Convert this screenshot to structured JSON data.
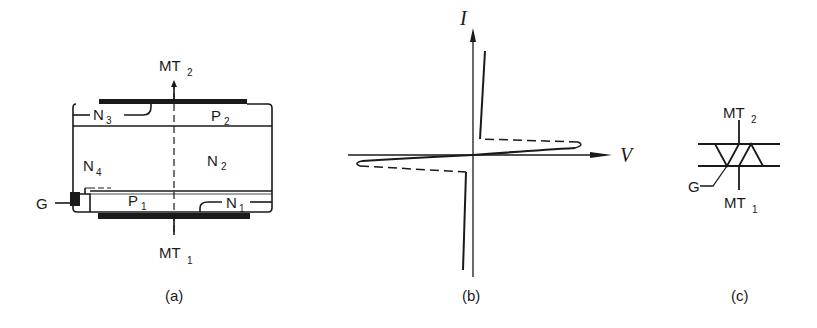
{
  "figure": {
    "panels": [
      {
        "id": "a",
        "caption": "(a)",
        "description": "Triac cross-section structure",
        "terminals": {
          "top": "MT",
          "top_sub": "2",
          "bottom": "MT",
          "bottom_sub": "1",
          "gate": "G"
        },
        "regions": [
          {
            "name": "N",
            "sub": "3"
          },
          {
            "name": "P",
            "sub": "2"
          },
          {
            "name": "N",
            "sub": "4"
          },
          {
            "name": "N",
            "sub": "2"
          },
          {
            "name": "P",
            "sub": "1"
          },
          {
            "name": "N",
            "sub": "1"
          }
        ]
      },
      {
        "id": "b",
        "caption": "(b)",
        "description": "Triac I-V characteristic",
        "axes": {
          "y_label": "I",
          "x_label": "V"
        }
      },
      {
        "id": "c",
        "caption": "(c)",
        "description": "Triac circuit symbol",
        "terminals": {
          "top": "MT",
          "top_sub": "2",
          "bottom": "MT",
          "bottom_sub": "1",
          "gate": "G"
        }
      }
    ]
  },
  "colors": {
    "ink": "#1a1a1a",
    "background": "#ffffff"
  }
}
